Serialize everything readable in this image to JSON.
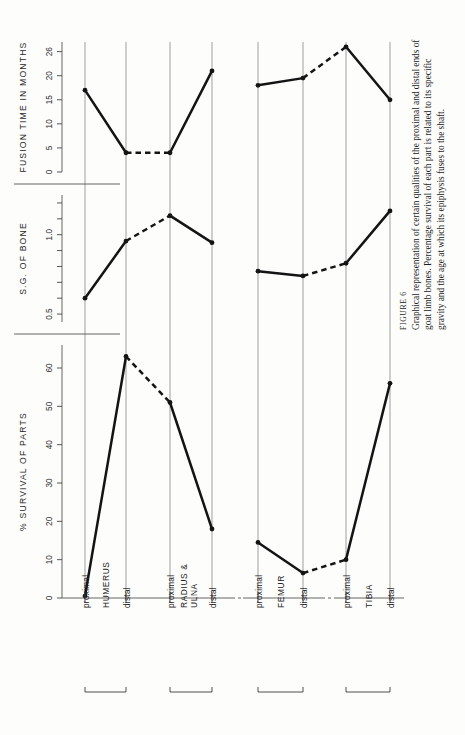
{
  "figure": {
    "number_label": "FIGURE 6",
    "caption": "Graphical representation of certain qualities of the proximal and distal ends of goat limb bones. Percentage survival of each part is related to its specific gravity and the age at which its epiphysis fuses to the shaft."
  },
  "chart_data": {
    "type": "line",
    "title": "Graphical representation of certain qualities of the proximal and distal ends of goat limb bones",
    "orientation": "rotated-90-ccw",
    "xlabel": "",
    "categories": [
      "HUMERUS proximal",
      "HUMERUS distal",
      "RADIUS & ULNA proximal",
      "RADIUS & ULNA distal",
      "FEMUR proximal",
      "FEMUR distal",
      "TIBIA proximal",
      "TIBIA distal"
    ],
    "bone_groups": [
      {
        "name": "HUMERUS",
        "ends": [
          "proximal",
          "distal"
        ]
      },
      {
        "name": "RADIUS & ULNA",
        "ends": [
          "proximal",
          "distal"
        ]
      },
      {
        "name": "FEMUR",
        "ends": [
          "proximal",
          "distal"
        ]
      },
      {
        "name": "TIBIA",
        "ends": [
          "proximal",
          "distal"
        ]
      }
    ],
    "panels": [
      {
        "id": "fusion",
        "ylabel": "FUSION TIME IN MONTHS",
        "ticks": [
          0,
          5,
          10,
          15,
          20,
          25
        ],
        "tick_labels": [
          "0",
          "5",
          "10",
          "15",
          "20",
          "26"
        ],
        "ylim": [
          0,
          27
        ],
        "values": [
          17,
          4,
          4,
          21,
          18,
          19.5,
          26,
          15
        ],
        "segments": [
          {
            "style": "solid",
            "from": 0,
            "to": 1
          },
          {
            "style": "dashed",
            "from": 1,
            "to": 2
          },
          {
            "style": "solid",
            "from": 2,
            "to": 3
          },
          {
            "style": "solid",
            "from": 4,
            "to": 5
          },
          {
            "style": "dashed",
            "from": 5,
            "to": 6
          },
          {
            "style": "solid",
            "from": 6,
            "to": 7
          }
        ]
      },
      {
        "id": "sg",
        "ylabel": "S.G. OF BONE",
        "ticks": [
          0.5,
          0.6,
          0.7,
          0.8,
          0.9,
          1.0,
          1.1,
          1.2
        ],
        "tick_labels": [
          "0.5",
          "",
          "",
          "",
          "",
          "1.0",
          "",
          ""
        ],
        "ylim": [
          0.45,
          1.25
        ],
        "values": [
          0.6,
          0.96,
          1.12,
          0.95,
          0.77,
          0.74,
          0.82,
          1.15
        ],
        "segments": [
          {
            "style": "solid",
            "from": 0,
            "to": 1
          },
          {
            "style": "dashed",
            "from": 1,
            "to": 2
          },
          {
            "style": "solid",
            "from": 2,
            "to": 3
          },
          {
            "style": "solid",
            "from": 4,
            "to": 5
          },
          {
            "style": "dashed",
            "from": 5,
            "to": 6
          },
          {
            "style": "solid",
            "from": 6,
            "to": 7
          }
        ]
      },
      {
        "id": "survival",
        "ylabel": "% SURVIVAL OF PARTS",
        "ticks": [
          0,
          10,
          20,
          30,
          40,
          50,
          60
        ],
        "tick_labels": [
          "0",
          "10",
          "20",
          "30",
          "40",
          "50",
          "60"
        ],
        "ylim": [
          0,
          66
        ],
        "values": [
          0.5,
          63,
          51,
          18,
          14.5,
          6.5,
          10,
          56
        ],
        "segments": [
          {
            "style": "solid",
            "from": 0,
            "to": 1
          },
          {
            "style": "dashed",
            "from": 1,
            "to": 2
          },
          {
            "style": "solid",
            "from": 2,
            "to": 3
          },
          {
            "style": "solid",
            "from": 4,
            "to": 5
          },
          {
            "style": "dashed",
            "from": 5,
            "to": 6
          },
          {
            "style": "solid",
            "from": 6,
            "to": 7
          }
        ]
      }
    ],
    "grid": true,
    "legend": "none",
    "colors": {
      "line": "#141414",
      "grid": "#8e8e8e",
      "background": "#fdfdfc"
    }
  }
}
